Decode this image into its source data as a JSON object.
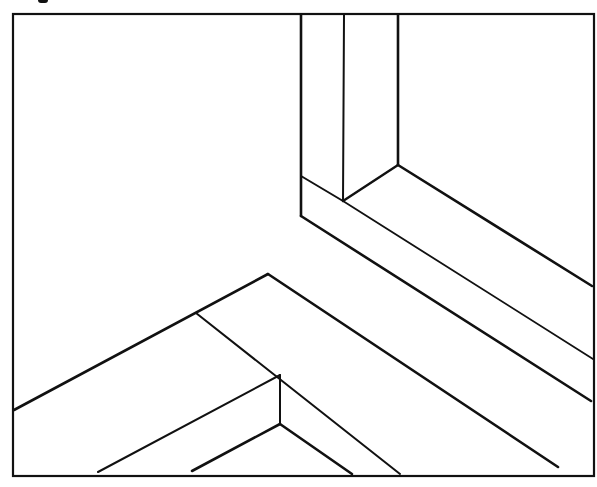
{
  "figure": {
    "kind": "isometric line drawing",
    "stroke_color": "#111111",
    "background": "#ffffff",
    "frame": {
      "x": 13,
      "y": 14,
      "width": 581,
      "height": 462
    },
    "lines": [
      {
        "id": "upper-post-left",
        "points": [
          [
            301,
            15
          ],
          [
            301,
            216
          ]
        ],
        "w": 2.6
      },
      {
        "id": "upper-post-mid",
        "points": [
          [
            344,
            15
          ],
          [
            343,
            201
          ]
        ],
        "w": 2
      },
      {
        "id": "upper-post-right",
        "points": [
          [
            398,
            15
          ],
          [
            398,
            165
          ]
        ],
        "w": 2.6
      },
      {
        "id": "upper-cap-left",
        "points": [
          [
            301,
            176
          ],
          [
            343,
            201
          ]
        ],
        "w": 2
      },
      {
        "id": "upper-cap-right",
        "points": [
          [
            343,
            201
          ],
          [
            398,
            165
          ]
        ],
        "w": 2.4
      },
      {
        "id": "upper-rail-top",
        "points": [
          [
            398,
            165
          ],
          [
            592,
            286
          ]
        ],
        "w": 2.6
      },
      {
        "id": "upper-rail-mid",
        "points": [
          [
            343,
            201
          ],
          [
            593,
            359
          ]
        ],
        "w": 1.8
      },
      {
        "id": "upper-rail-bottom",
        "points": [
          [
            301,
            216
          ],
          [
            591,
            401
          ]
        ],
        "w": 2.6
      },
      {
        "id": "lower-ridge-left",
        "points": [
          [
            268,
            274
          ],
          [
            14,
            410
          ]
        ],
        "w": 2.6
      },
      {
        "id": "lower-ridge-right",
        "points": [
          [
            268,
            274
          ],
          [
            558,
            467
          ]
        ],
        "w": 2.6
      },
      {
        "id": "lower-inner-diag",
        "points": [
          [
            196,
            313
          ],
          [
            400,
            474
          ]
        ],
        "w": 2
      },
      {
        "id": "lower-inner-left",
        "points": [
          [
            280,
            375
          ],
          [
            98,
            472
          ]
        ],
        "w": 2
      },
      {
        "id": "lower-post",
        "points": [
          [
            280,
            375
          ],
          [
            280,
            424
          ]
        ],
        "w": 2
      },
      {
        "id": "lower-foot-left",
        "points": [
          [
            280,
            424
          ],
          [
            192,
            471
          ]
        ],
        "w": 2.6
      },
      {
        "id": "lower-foot-right",
        "points": [
          [
            280,
            424
          ],
          [
            352,
            474
          ]
        ],
        "w": 2.6
      }
    ]
  }
}
